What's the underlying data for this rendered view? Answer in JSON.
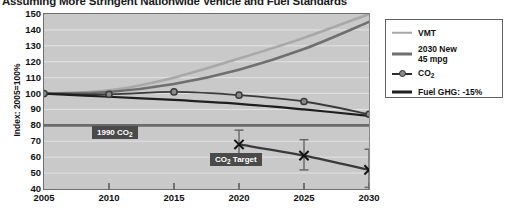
{
  "chart_data": {
    "type": "line",
    "title": "Assuming More Stringent Nationwide Vehicle and Fuel Standards",
    "xlabel": "",
    "ylabel": "Index: 2005=100%",
    "x": [
      2005,
      2010,
      2015,
      2020,
      2025,
      2030
    ],
    "xlim": [
      2005,
      2030
    ],
    "ylim": [
      40,
      150
    ],
    "yticks": [
      150,
      140,
      130,
      120,
      110,
      100,
      90,
      80,
      70,
      60,
      50,
      40
    ],
    "xticks": [
      2005,
      2010,
      2015,
      2020,
      2025,
      2030
    ],
    "grid": true,
    "grid_axis": "y",
    "legend_position": "right-outside",
    "plot_bgcolor": "#c9c9c9",
    "series": [
      {
        "name": "VMT",
        "color": "#a8a8a8",
        "marker": "none",
        "width": 2.6,
        "values": [
          100,
          102,
          110,
          122,
          135,
          150
        ]
      },
      {
        "name": "2030 New 45 mpg",
        "color": "#6f6f6f",
        "marker": "none",
        "width": 2.6,
        "values": [
          100,
          101,
          106,
          115,
          128,
          145
        ]
      },
      {
        "name": "CO2",
        "color": "#3a3a3a",
        "marker": "circle",
        "marker_fill": "#8a8a8a",
        "width": 1.8,
        "values": [
          100,
          99.5,
          101,
          99,
          95,
          87
        ]
      },
      {
        "name": "Fuel GHG: -15%",
        "color": "#1e1e1e",
        "marker": "none",
        "width": 2.2,
        "values": [
          100,
          98,
          96,
          93.5,
          90,
          86
        ]
      },
      {
        "name": "CO2 Target",
        "color": "#3a3a3a",
        "marker": "x",
        "width": 2.2,
        "x": [
          2020,
          2025,
          2030
        ],
        "values": [
          68,
          61,
          52
        ],
        "error_upper": [
          77,
          71,
          65
        ],
        "error_lower": [
          60,
          52,
          41
        ]
      }
    ],
    "reference_lines": [
      {
        "name": "1990 CO2",
        "value": 80,
        "color": "#6b6b6b",
        "width": 2.6,
        "label": "1990 CO"
      }
    ],
    "annotations": [
      {
        "name": "1990-co2-label",
        "text": "1990 CO",
        "sub": "2"
      },
      {
        "name": "co2-target-label",
        "text": "CO",
        "sub": "2",
        "text_after": " Target"
      }
    ]
  },
  "legend": {
    "entries": [
      {
        "label": "VMT",
        "sub": "",
        "label_after": "",
        "swatch": "line-light",
        "two_line": false,
        "line1": "",
        "line2": ""
      },
      {
        "label": "",
        "sub": "",
        "label_after": "",
        "swatch": "line-medium",
        "two_line": true,
        "line1": "2030 New",
        "line2": "45 mpg"
      },
      {
        "label": "CO",
        "sub": "2",
        "label_after": "",
        "swatch": "line-marker",
        "two_line": false,
        "line1": "",
        "line2": ""
      },
      {
        "label": "Fuel GHG: -15%",
        "sub": "",
        "label_after": "",
        "swatch": "line-dark",
        "two_line": false,
        "line1": "",
        "line2": ""
      }
    ]
  },
  "axis": {
    "y_title": "Index: 2005=100%",
    "y_labels": [
      "150",
      "140",
      "130",
      "120",
      "110",
      "100",
      "90",
      "80",
      "70",
      "60",
      "50",
      "40"
    ],
    "x_labels": [
      "2005",
      "2010",
      "2015",
      "2020",
      "2025",
      "2030"
    ]
  },
  "annotations": {
    "ref_1990_text": "1990 CO",
    "ref_1990_sub": "2",
    "target_text": "CO",
    "target_sub": "2",
    "target_text_after": " Target"
  }
}
